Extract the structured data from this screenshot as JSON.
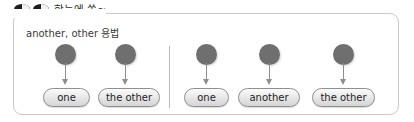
{
  "header": {
    "title": "한눈에 쏙~",
    "icons": [
      "eye-left-icon",
      "eye-right-icon"
    ]
  },
  "subtitle": "another, other 용법",
  "colors": {
    "frame_border": "#c9c9c9",
    "node_circle": "#6f6f6f",
    "arrow": "#8e8e8e",
    "pill_border": "#8f8f8f",
    "pill_fill": "#e6e6e6",
    "divider": "#b9b9b9",
    "text": "#1f1f1f",
    "background": "#ffffff"
  },
  "groups": [
    {
      "name": "two-item-group",
      "nodes": [
        {
          "label": "one",
          "circle_x": 65,
          "pill_x": 43,
          "pill_w": 47
        },
        {
          "label": "the other",
          "circle_x": 125,
          "pill_x": 98,
          "pill_w": 62
        }
      ]
    },
    {
      "name": "three-item-group",
      "nodes": [
        {
          "label": "one",
          "circle_x": 206,
          "pill_x": 184,
          "pill_w": 45
        },
        {
          "label": "another",
          "circle_x": 269,
          "pill_x": 238,
          "pill_w": 62
        },
        {
          "label": "the other",
          "circle_x": 343,
          "pill_x": 312,
          "pill_w": 63
        }
      ]
    }
  ],
  "divider": {
    "x": 169,
    "y": 46,
    "height": 62
  }
}
